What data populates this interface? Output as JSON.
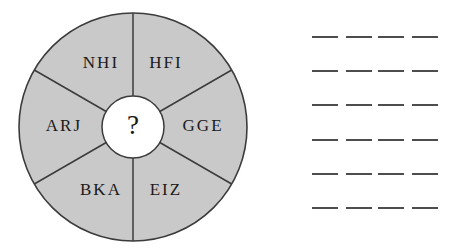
{
  "figure": {
    "name": "letter-wheel-puzzle",
    "wheel": {
      "sectors": [
        {
          "id": "sector-top-right",
          "label": "HFI",
          "angle_deg": 60,
          "text_x": 166,
          "text_y": 64
        },
        {
          "id": "sector-right",
          "label": "GGE",
          "angle_deg": 0,
          "text_x": 203,
          "text_y": 127
        },
        {
          "id": "sector-bottom-right",
          "label": "EIZ",
          "angle_deg": -60,
          "text_x": 166,
          "text_y": 191
        },
        {
          "id": "sector-bottom-left",
          "label": "BKA",
          "angle_deg": -120,
          "text_x": 101,
          "text_y": 191
        },
        {
          "id": "sector-left",
          "label": "ARJ",
          "angle_deg": 180,
          "text_x": 64,
          "text_y": 127
        },
        {
          "id": "sector-top-left",
          "label": "NHI",
          "angle_deg": 120,
          "text_x": 101,
          "text_y": 64
        }
      ],
      "hub_label": "?",
      "center_x": 133,
      "center_y": 127,
      "outer_radius": 114,
      "hub_radius": 31,
      "fill_color": "#c9c9c9",
      "hub_fill_color": "#ffffff",
      "stroke_color": "#3b3b3b",
      "text_color": "#1a1a1a"
    }
  },
  "answer_area": {
    "name": "answer-blanks",
    "rows": 6,
    "blanks_per_row": 4,
    "blank_color": "#4d4d4d",
    "blank_pitch_px": 33,
    "blank_width_px": 26,
    "row_pitch_px": 34.2
  }
}
